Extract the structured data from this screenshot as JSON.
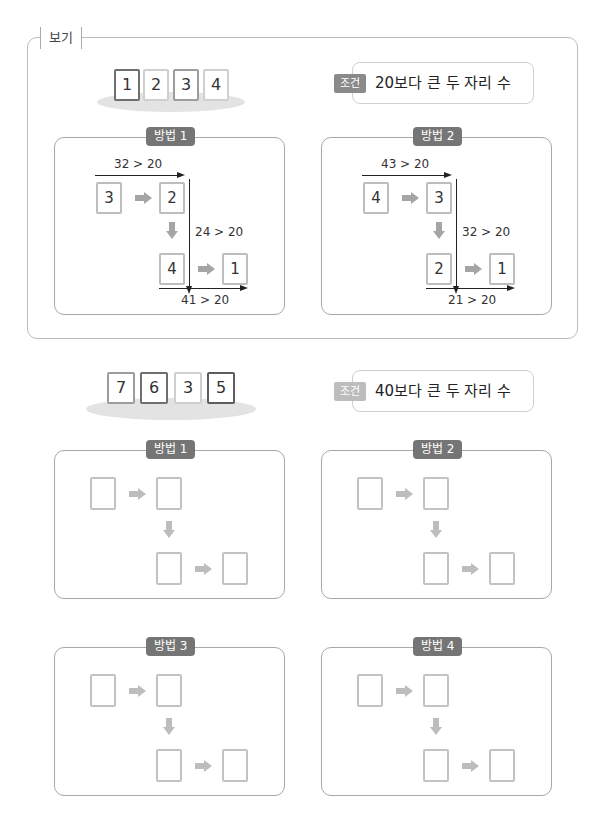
{
  "example": {
    "label": "보기",
    "cards": [
      {
        "value": "1",
        "border": "dark"
      },
      {
        "value": "2",
        "border": "light"
      },
      {
        "value": "3",
        "border": "med"
      },
      {
        "value": "4",
        "border": "light"
      }
    ],
    "condition": {
      "tag": "조건",
      "text": "20보다 큰 두 자리 수",
      "tag_color": "#8a8a8a"
    },
    "methods": [
      {
        "title": "방법 1",
        "cards": [
          "3",
          "2",
          "4",
          "1"
        ],
        "comparisons": [
          "32 > 20",
          "24 > 20",
          "41 > 20"
        ]
      },
      {
        "title": "방법 2",
        "cards": [
          "4",
          "3",
          "2",
          "1"
        ],
        "comparisons": [
          "43 > 20",
          "32 > 20",
          "21 > 20"
        ]
      }
    ]
  },
  "problem": {
    "cards": [
      {
        "value": "7",
        "border": "med"
      },
      {
        "value": "6",
        "border": "dark"
      },
      {
        "value": "3",
        "border": "light"
      },
      {
        "value": "5",
        "border": "darkest"
      }
    ],
    "condition": {
      "tag": "조건",
      "text": "40보다 큰 두 자리 수",
      "tag_color": "#bdbdbd"
    },
    "methods": [
      {
        "title": "방법 1"
      },
      {
        "title": "방법 2"
      },
      {
        "title": "방법 3"
      },
      {
        "title": "방법 4"
      }
    ]
  },
  "colors": {
    "panel_tag": "#757575",
    "arrow": "#b5b5b5",
    "frame": "#bdbdbd"
  }
}
